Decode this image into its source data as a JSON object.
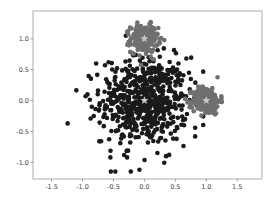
{
  "chart_data": {
    "type": "scatter",
    "title": "",
    "xlabel": "",
    "ylabel": "",
    "xlim": [
      -1.8,
      1.9
    ],
    "ylim": [
      -1.27,
      1.45
    ],
    "grid": false,
    "legend": null,
    "xticks": [
      -1.5,
      -1.0,
      -0.5,
      0.0,
      0.5,
      1.0,
      1.5
    ],
    "xtick_labels": [
      "-1.5",
      "-1.0",
      "-0.5",
      "0.0",
      "0.5",
      "1.0",
      "1.5"
    ],
    "yticks": [
      -1.0,
      -0.5,
      0.0,
      0.5,
      1.0
    ],
    "ytick_labels": [
      "-1.0",
      "-0.5",
      "0.0",
      "0.5",
      "1.0"
    ],
    "series": [
      {
        "name": "cluster-center-origin",
        "color": "#1a1a1a",
        "marker": "circle",
        "center": [
          0.0,
          0.0
        ],
        "std": 0.35,
        "count": 600,
        "outliers": [
          [
            -1.24,
            -0.37
          ],
          [
            -0.47,
            -1.15
          ],
          [
            -0.22,
            -1.15
          ],
          [
            -0.08,
            -1.12
          ],
          [
            -0.55,
            -0.92
          ],
          [
            -0.28,
            -0.92
          ],
          [
            -0.7,
            -0.66
          ],
          [
            -0.78,
            0.6
          ],
          [
            -0.3,
            1.05
          ],
          [
            0.21,
            -0.85
          ],
          [
            0.35,
            -0.9
          ],
          [
            0.4,
            -0.88
          ],
          [
            0.82,
            -0.44
          ],
          [
            0.82,
            -0.58
          ],
          [
            0.52,
            -0.62
          ],
          [
            0.64,
            -0.4
          ],
          [
            -0.92,
            0.1
          ],
          [
            -0.95,
            0.07
          ],
          [
            -0.85,
            -0.1
          ],
          [
            0.55,
            0.6
          ],
          [
            0.72,
            0.45
          ],
          [
            0.75,
            0.35
          ],
          [
            0.4,
            0.48
          ],
          [
            -0.6,
            0.3
          ]
        ]
      },
      {
        "name": "cluster-top",
        "color": "#707070",
        "marker": "circle",
        "center": [
          0.0,
          1.0
        ],
        "std": 0.11,
        "count": 250
      },
      {
        "name": "cluster-right",
        "color": "#707070",
        "marker": "circle",
        "center": [
          1.0,
          0.0
        ],
        "std": 0.11,
        "count": 250
      }
    ],
    "centroids": {
      "marker": "star",
      "color": "#c8c8c8",
      "points": [
        [
          0.0,
          0.0
        ],
        [
          0.0,
          1.0
        ],
        [
          1.0,
          0.0
        ]
      ]
    }
  }
}
